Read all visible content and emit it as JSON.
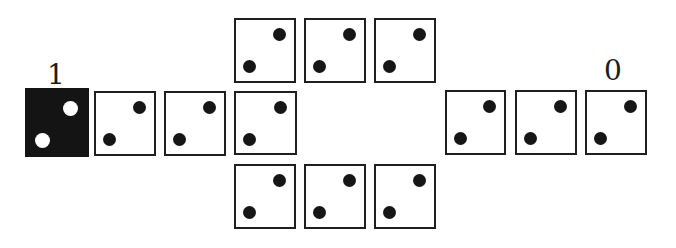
{
  "figure": {
    "background_color": "#ffffff",
    "ink_color": "#1f1f1f",
    "inverted_fill_color": "#141414",
    "label_input": {
      "text": "1"
    },
    "label_output": {
      "text": "0"
    },
    "pip_pattern": [
      "top-right",
      "bottom-left"
    ],
    "cells": [
      {
        "id": "input-cell",
        "row": "middle",
        "variant": "inverted",
        "x": 25,
        "y": 88,
        "w": 64,
        "h": 69,
        "pips": [
          "top-right",
          "bottom-left"
        ]
      },
      {
        "id": "middle-cell-1",
        "row": "middle",
        "variant": "normal",
        "x": 94,
        "y": 91,
        "w": 62,
        "h": 65,
        "pips": [
          "top-right",
          "bottom-left"
        ]
      },
      {
        "id": "middle-cell-2",
        "row": "middle",
        "variant": "normal",
        "x": 164,
        "y": 91,
        "w": 62,
        "h": 65,
        "pips": [
          "top-right",
          "bottom-left"
        ]
      },
      {
        "id": "branch-cell",
        "row": "middle",
        "variant": "normal",
        "x": 234,
        "y": 91,
        "w": 63,
        "h": 64,
        "pips": [
          "top-right",
          "bottom-left"
        ]
      },
      {
        "id": "top-cell-1",
        "row": "top",
        "variant": "normal",
        "x": 234,
        "y": 18,
        "w": 62,
        "h": 65,
        "pips": [
          "top-right",
          "bottom-left"
        ]
      },
      {
        "id": "top-cell-2",
        "row": "top",
        "variant": "normal",
        "x": 304,
        "y": 18,
        "w": 62,
        "h": 65,
        "pips": [
          "top-right",
          "bottom-left"
        ]
      },
      {
        "id": "top-cell-3",
        "row": "top",
        "variant": "normal",
        "x": 374,
        "y": 18,
        "w": 62,
        "h": 65,
        "pips": [
          "top-right",
          "bottom-left"
        ]
      },
      {
        "id": "bottom-cell-1",
        "row": "bottom",
        "variant": "normal",
        "x": 234,
        "y": 164,
        "w": 62,
        "h": 65,
        "pips": [
          "top-right",
          "bottom-left"
        ]
      },
      {
        "id": "bottom-cell-2",
        "row": "bottom",
        "variant": "normal",
        "x": 304,
        "y": 164,
        "w": 62,
        "h": 65,
        "pips": [
          "top-right",
          "bottom-left"
        ]
      },
      {
        "id": "bottom-cell-3",
        "row": "bottom",
        "variant": "normal",
        "x": 374,
        "y": 164,
        "w": 62,
        "h": 65,
        "pips": [
          "top-right",
          "bottom-left"
        ]
      },
      {
        "id": "output-cell-1",
        "row": "middle",
        "variant": "normal",
        "x": 445,
        "y": 90,
        "w": 61,
        "h": 65,
        "pips": [
          "top-right",
          "bottom-left"
        ]
      },
      {
        "id": "output-cell-2",
        "row": "middle",
        "variant": "normal",
        "x": 515,
        "y": 90,
        "w": 62,
        "h": 65,
        "pips": [
          "top-right",
          "bottom-left"
        ]
      },
      {
        "id": "output-cell-3",
        "row": "middle",
        "variant": "normal",
        "x": 585,
        "y": 90,
        "w": 62,
        "h": 65,
        "pips": [
          "top-right",
          "bottom-left"
        ]
      }
    ]
  }
}
